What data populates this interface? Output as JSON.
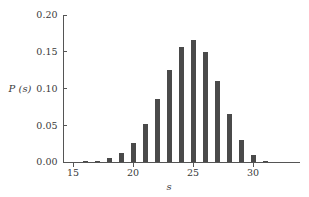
{
  "chart_data": {
    "type": "bar",
    "title": "",
    "subtitle": "",
    "xlabel": "s",
    "ylabel": "P (s)",
    "xlim": [
      14.3,
      32.2
    ],
    "ylim": [
      0.0,
      0.2
    ],
    "grid": false,
    "legend": null,
    "bar_color": "#4a4a4a",
    "axis_color": "#555555",
    "background_color": "#ffffff",
    "xticks": [
      15,
      20,
      25,
      30
    ],
    "xtick_labels": [
      "15",
      "20",
      "25",
      "30"
    ],
    "yticks": [
      0.0,
      0.05,
      0.1,
      0.15,
      0.2
    ],
    "ytick_labels": [
      "0.00",
      "0.05",
      "0.10",
      "0.15",
      "0.20"
    ],
    "categories": [
      15,
      16,
      17,
      18,
      19,
      20,
      21,
      22,
      23,
      24,
      25,
      26,
      27,
      28,
      29,
      30,
      31
    ],
    "values": [
      0.0,
      0.001,
      0.002,
      0.005,
      0.012,
      0.026,
      0.052,
      0.086,
      0.125,
      0.157,
      0.166,
      0.149,
      0.11,
      0.065,
      0.03,
      0.01,
      0.002
    ]
  }
}
